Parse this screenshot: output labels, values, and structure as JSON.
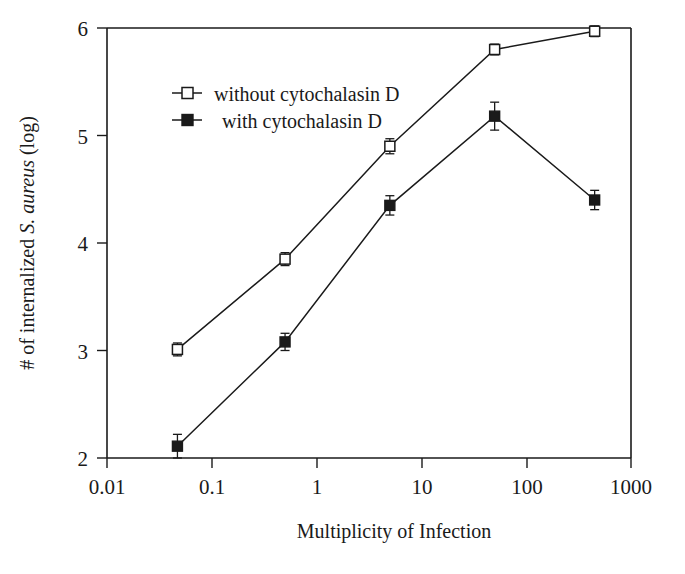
{
  "chart_data": {
    "type": "line",
    "title": "",
    "xlabel": "Multiplicity of Infection",
    "ylabel_parts": {
      "pre": "# of internalized ",
      "italic": "S. aureus",
      "post": " (log)"
    },
    "ylabel": "# of internalized S. aureus (log)",
    "xscale": "log",
    "yscale": "linear",
    "xlim": [
      0.01,
      1000
    ],
    "ylim": [
      2,
      6
    ],
    "xticks": [
      0.01,
      0.1,
      1,
      10,
      100,
      1000
    ],
    "xtick_labels": [
      "0.01",
      "0.1",
      "1",
      "10",
      "100",
      "1000"
    ],
    "yticks": [
      2,
      3,
      4,
      5,
      6
    ],
    "ytick_labels": [
      "2",
      "3",
      "4",
      "5",
      "6"
    ],
    "grid": false,
    "legend_position": "upper-left-inside",
    "series": [
      {
        "name": "without cytochalasin D",
        "marker": "open-square",
        "x": [
          0.047,
          0.5,
          5,
          50,
          450
        ],
        "values": [
          3.01,
          3.85,
          4.9,
          5.8,
          5.97
        ],
        "errors": [
          0.06,
          0.06,
          0.07,
          0.05,
          0.05
        ]
      },
      {
        "name": "with cytochalasin D",
        "marker": "filled-square",
        "x": [
          0.047,
          0.5,
          5,
          50,
          450
        ],
        "values": [
          2.11,
          3.08,
          4.35,
          5.18,
          4.4
        ],
        "errors": [
          0.11,
          0.08,
          0.09,
          0.13,
          0.09
        ]
      }
    ],
    "legend": [
      {
        "label": "without cytochalasin D",
        "marker": "open-square"
      },
      {
        "label": "with cytochalasin D",
        "marker": "filled-square"
      }
    ]
  }
}
